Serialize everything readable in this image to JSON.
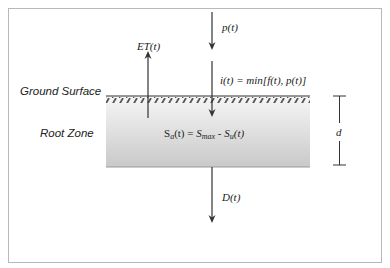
{
  "diagram": {
    "type": "soil water balance schematic",
    "labels": {
      "ground_surface": "Ground Surface",
      "root_zone": "Root Zone",
      "precipitation": "p(t)",
      "evapotranspiration": "ET(t)",
      "infiltration": "i(t) = min[f(t), p(t)]",
      "storage": "Sa(t) = Smax - Su(t)",
      "drainage": "D(t)",
      "depth": "d"
    },
    "storage_parts": {
      "lhs": "S",
      "lhs_sub": "a",
      "lhs_arg": "(t) = ",
      "smax": "S",
      "smax_sub": "max",
      "minus": " - ",
      "su": "S",
      "su_sub": "u",
      "su_arg": "(t)"
    },
    "colors": {
      "frame_border": "#b8b8b8",
      "line": "#333333",
      "soil_top": "#f4f4f4",
      "soil_bottom": "#c8c8c8",
      "hatch": "#555555"
    }
  }
}
